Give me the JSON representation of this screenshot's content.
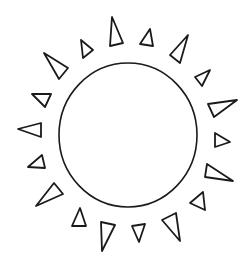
{
  "drawing": {
    "subject": "sun",
    "stroke_color": "#1a1a1a",
    "background": "#ffffff",
    "circle": {
      "cx": 128,
      "cy": 135,
      "rx": 69,
      "ry": 72
    },
    "rays": [
      "112,17 110,46 123,43",
      "150,29 140,44 153,46",
      "188,35 170,55 180,63",
      "210,70 195,77 202,86",
      "237,100 208,104 214,117",
      "215,133 230,142 215,147",
      "207,164 233,181 205,177",
      "203,192 190,203 205,210",
      "176,213 162,220 180,241",
      "132,226 145,224 139,242",
      "101,222 115,225 102,251",
      "80,208 86,226 72,226",
      "54,183 63,194 36,206",
      "42,155 45,168 28,167",
      "18,129 41,123 41,137",
      "32,94 51,94 45,107",
      "44,53 68,68 59,79",
      "81,40 93,50 83,58"
    ]
  }
}
